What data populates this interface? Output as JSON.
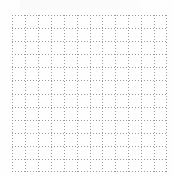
{
  "sheet": {
    "type": "dotted-grid-paper",
    "columns": 12,
    "rows": 12,
    "line_color": "#9a9a9a",
    "background": "#fefefe"
  }
}
